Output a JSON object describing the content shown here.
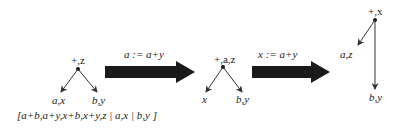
{
  "trees": [
    {
      "id": "tree-1",
      "root": {
        "label": "+,z"
      },
      "children": [
        {
          "label": "a,x"
        },
        {
          "label": "b,y"
        }
      ],
      "caption": "[a+b,a+y,x+b,x+y,z | a,x | b,y ]"
    },
    {
      "id": "tree-2",
      "root": {
        "label": "+,a,z"
      },
      "children": [
        {
          "label": "x"
        },
        {
          "label": "b,y"
        }
      ]
    },
    {
      "id": "tree-3",
      "root": {
        "label": "+,x"
      },
      "children": [
        {
          "label": "a,z"
        },
        {
          "label": "b,y"
        }
      ]
    }
  ],
  "transitions": [
    {
      "label": "a := a+y"
    },
    {
      "label": "x := a+y"
    }
  ],
  "colors": {
    "ink": "#222222",
    "arrow": "#1a1a1a",
    "background": "#ffffff"
  }
}
